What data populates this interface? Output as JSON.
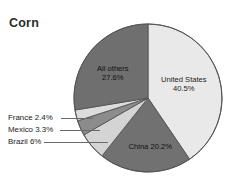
{
  "title": "Corn",
  "chart_data": {
    "type": "pie",
    "title": "Corn",
    "xlabel": "",
    "ylabel": "",
    "unit": "%",
    "total": 100,
    "legend": "none",
    "grid": false,
    "categories": [
      "United States",
      "China",
      "Brazil",
      "Mexico",
      "France",
      "All others"
    ],
    "values": [
      40.5,
      20.2,
      6,
      3.3,
      2.4,
      27.6
    ],
    "start_angle_deg": 0,
    "direction": "clockwise",
    "slices": [
      {
        "name": "United States",
        "label": "United States",
        "value": 40.5,
        "value_text": "40.5%",
        "color": "#e9e9e9",
        "label_placement": "inside",
        "label_x": 184,
        "label_y": 84
      },
      {
        "name": "China",
        "label": "China 20.2%",
        "value": 20.2,
        "value_text": "20.2%",
        "color": "#717171",
        "label_placement": "inside",
        "label_x": 150,
        "label_y": 146
      },
      {
        "name": "Brazil",
        "label": "Brazil 6%",
        "value": 6,
        "value_text": "6%",
        "color": "#d4d4d4",
        "label_placement": "callout",
        "callout_label_x": 8,
        "callout_label_y": 137,
        "leader_x": 44,
        "leader_y": 142,
        "leader_w": 64
      },
      {
        "name": "Mexico",
        "label": "Mexico 3.3%",
        "value": 3.3,
        "value_text": "3.3%",
        "color": "#8c8c8c",
        "label_placement": "callout",
        "callout_label_x": 8,
        "callout_label_y": 125,
        "leader_x": 60,
        "leader_y": 130,
        "leader_w": 40
      },
      {
        "name": "France",
        "label": "France 2.4%",
        "value": 2.4,
        "value_text": "2.4%",
        "color": "#dcdcdc",
        "label_placement": "callout",
        "callout_label_x": 8,
        "callout_label_y": 113,
        "leader_x": 61,
        "leader_y": 118,
        "leader_w": 32
      },
      {
        "name": "All others",
        "label": "All others",
        "value": 27.6,
        "value_text": "27.6%",
        "color": "#6f6f6f",
        "label_placement": "inside",
        "label_x": 113,
        "label_y": 73
      }
    ],
    "geometry": {
      "center_x": 148,
      "center_y": 98,
      "radius": 74
    },
    "colors": {
      "background": "#ffffff",
      "outline": "#555555",
      "title": "#2b2b2b",
      "leader_line": "#6a6a6a"
    }
  }
}
